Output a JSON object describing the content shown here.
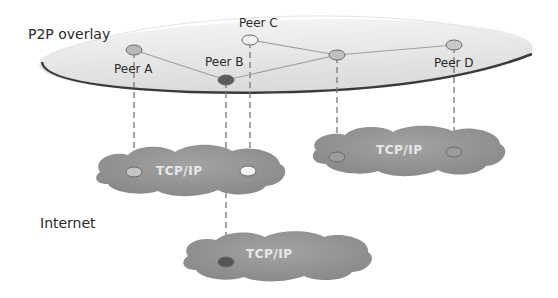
{
  "diagram": {
    "overlay_label": "P2P overlay",
    "internet_label": "Internet",
    "peers": [
      {
        "id": "a",
        "label": "Peer A",
        "x": 134,
        "y": 50,
        "fill": "#b8b8b8"
      },
      {
        "id": "b",
        "label": "Peer B",
        "x": 226,
        "y": 80,
        "fill": "#5a5a5a"
      },
      {
        "id": "c",
        "label": "Peer C",
        "x": 250,
        "y": 40,
        "fill": "#f2f2f2"
      },
      {
        "id": "x",
        "label": "",
        "x": 337,
        "y": 55,
        "fill": "#c0c0c0"
      },
      {
        "id": "d",
        "label": "Peer D",
        "x": 454,
        "y": 45,
        "fill": "#c8c8c8"
      }
    ],
    "overlay_links": [
      [
        "a",
        "b"
      ],
      [
        "b",
        "x"
      ],
      [
        "c",
        "x"
      ],
      [
        "x",
        "d"
      ]
    ],
    "clouds": [
      {
        "id": "cloud-left",
        "label": "TCP/IP"
      },
      {
        "id": "cloud-right",
        "label": "TCP/IP"
      },
      {
        "id": "cloud-bottom",
        "label": "TCP/IP"
      }
    ],
    "colors": {
      "overlay_fill": "#e6e6e6",
      "overlay_edge": "#3a3a3a",
      "cloud_fill": "#8f8f8f",
      "link": "#a0a0a0",
      "dashed": "#777777"
    }
  }
}
